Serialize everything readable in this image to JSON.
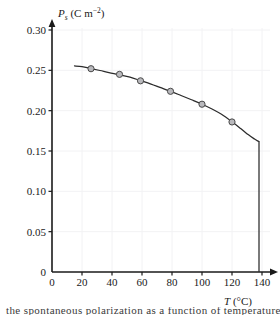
{
  "figure": {
    "background_color": "#ffffff",
    "axis_color": "#1a1a1a",
    "grid_color": "#f2f2f4",
    "curve_color": "#2b2b2b",
    "marker_fill": "#b9b9bd",
    "marker_stroke": "#4a4a4a",
    "bottom_caption": "the spontaneous polarization as a function of temperature"
  },
  "chart_data": {
    "type": "line",
    "title": "",
    "subtitle": "",
    "xlabel": "T (°C)",
    "xlabel_symbol": "T",
    "xlabel_unit": "(°C)",
    "ylabel": "P_s (C m−2)",
    "ylabel_symbol": "P",
    "ylabel_subscript": "s",
    "ylabel_unit": "(C m−2)",
    "xlim": [
      0,
      140
    ],
    "ylim": [
      0,
      0.3
    ],
    "grid": true,
    "legend": null,
    "legend_position": "none",
    "xticks": [
      0,
      20,
      40,
      60,
      80,
      100,
      120,
      140
    ],
    "xtick_labels": [
      "0",
      "20",
      "40",
      "60",
      "80",
      "100",
      "120",
      "140"
    ],
    "yticks": [
      0,
      0.05,
      0.1,
      0.15,
      0.2,
      0.25,
      0.3
    ],
    "ytick_labels": [
      "0",
      "0.05",
      "0.10",
      "0.15",
      "0.20",
      "0.25",
      "0.30"
    ],
    "series": [
      {
        "name": "Ps vs T",
        "marker": "circle",
        "x": [
          26,
          45,
          59,
          79,
          100,
          120
        ],
        "values": [
          0.252,
          0.245,
          0.237,
          0.224,
          0.208,
          0.186
        ]
      }
    ],
    "curve_x": [
      15,
      20,
      26,
      32,
      38,
      45,
      52,
      59,
      66,
      72,
      79,
      86,
      93,
      100,
      107,
      113,
      120,
      126,
      131,
      135,
      137,
      138
    ],
    "curve_y": [
      0.2555,
      0.2545,
      0.2522,
      0.2498,
      0.2472,
      0.2445,
      0.2415,
      0.2373,
      0.233,
      0.2288,
      0.224,
      0.2188,
      0.2135,
      0.208,
      0.2018,
      0.1955,
      0.1862,
      0.1775,
      0.17,
      0.1648,
      0.1625,
      0.1618
    ],
    "drop_x": 138,
    "drop_from": 0.1618,
    "drop_to": 0,
    "annotations": []
  }
}
